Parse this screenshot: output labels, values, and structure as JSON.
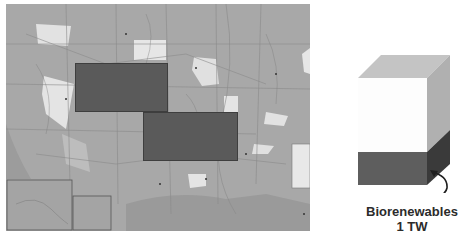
{
  "figure": {
    "map": {
      "description": "Grayscale map of the United States of America",
      "legend_title": "United States of America",
      "overlays": [
        {
          "name": "land-area-1",
          "x": 75,
          "y": 63,
          "width": 93,
          "height": 49,
          "color": "#5a5a5a"
        },
        {
          "name": "land-area-2",
          "x": 143,
          "y": 112,
          "width": 95,
          "height": 49,
          "color": "#5a5a5a"
        }
      ]
    },
    "cube": {
      "front_face_color": "#fdfdfd",
      "top_face_color": "#c4c4c4",
      "side_face_color": "#b0b0b0",
      "filled_front_color": "#5e5e5e",
      "filled_side_color": "#3a3a3a",
      "fill_fraction": 0.32
    },
    "label": {
      "line1": "Biorenewables",
      "line2": "1 TW"
    }
  }
}
